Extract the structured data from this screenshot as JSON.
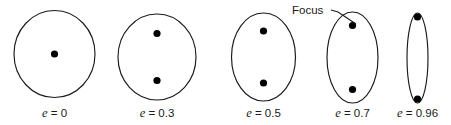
{
  "figure": {
    "background_color": "#ffffff",
    "stroke_color": "#1a1a1a",
    "dot_color": "#000000",
    "annotation": {
      "label": "Focus",
      "text_x": 292,
      "text_y": 13,
      "leader": "M331,10 L338,12 L356,24"
    },
    "ellipses": [
      {
        "id": "ellipse-e0",
        "eccentricity_label": "e",
        "eccentricity_value": "0",
        "caption_equals": " = ",
        "cx": 54.5,
        "cy": 54,
        "rx": 40.5,
        "ry": 43.5,
        "foci": [
          {
            "x": 54.5,
            "y": 54
          }
        ],
        "caption_x": 54.5,
        "caption_y": 117
      },
      {
        "id": "ellipse-e03",
        "eccentricity_label": "e",
        "eccentricity_value": "0.3",
        "caption_equals": " = ",
        "cx": 157,
        "cy": 57,
        "rx": 39,
        "ry": 43,
        "foci": [
          {
            "x": 157,
            "y": 33.5
          },
          {
            "x": 157,
            "y": 80.5
          }
        ],
        "caption_x": 157,
        "caption_y": 117
      },
      {
        "id": "ellipse-e05",
        "eccentricity_label": "e",
        "eccentricity_value": "0.5",
        "caption_equals": " = ",
        "cx": 263.5,
        "cy": 57,
        "rx": 32,
        "ry": 44,
        "foci": [
          {
            "x": 263.5,
            "y": 31
          },
          {
            "x": 263.5,
            "y": 83
          }
        ],
        "caption_x": 263.5,
        "caption_y": 117
      },
      {
        "id": "ellipse-e07",
        "eccentricity_label": "e",
        "eccentricity_value": "0.7",
        "caption_equals": " = ",
        "cx": 352.5,
        "cy": 57.5,
        "rx": 25.5,
        "ry": 45.5,
        "foci": [
          {
            "x": 352.5,
            "y": 25.5
          },
          {
            "x": 352.5,
            "y": 89.5
          }
        ],
        "caption_x": 352.5,
        "caption_y": 117
      },
      {
        "id": "ellipse-e096",
        "eccentricity_label": "e",
        "eccentricity_value": "0.96",
        "caption_equals": " = ",
        "cx": 417.5,
        "cy": 58,
        "rx": 10.5,
        "ry": 45,
        "foci": [
          {
            "x": 417.5,
            "y": 17
          },
          {
            "x": 417.5,
            "y": 99
          }
        ],
        "caption_x": 417.5,
        "caption_y": 117
      }
    ]
  }
}
